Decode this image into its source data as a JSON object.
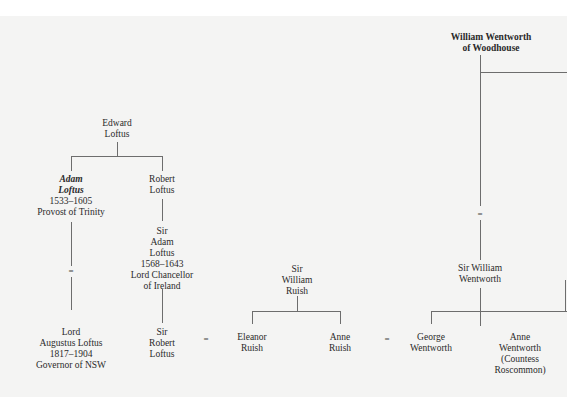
{
  "diagram": {
    "type": "family-tree",
    "nodes": {
      "william_wentworth_woodhouse": {
        "lines": [
          "William Wentworth",
          "of Woodhouse"
        ]
      },
      "edward_loftus": {
        "lines": [
          "Edward",
          "Loftus"
        ]
      },
      "adam_loftus": {
        "lines": [
          "Adam",
          "Loftus",
          "1533–1605",
          "Provost of Trinity"
        ]
      },
      "robert_loftus": {
        "lines": [
          "Robert",
          "Loftus"
        ]
      },
      "sir_adam_loftus": {
        "lines": [
          "Sir",
          "Adam",
          "Loftus",
          "1568–1643",
          "Lord Chancellor",
          "of Ireland"
        ]
      },
      "lord_augustus_loftus": {
        "lines": [
          "Lord",
          "Augustus Loftus",
          "1817–1904",
          "Governor of NSW"
        ]
      },
      "sir_robert_loftus": {
        "lines": [
          "Sir",
          "Robert",
          "Loftus"
        ]
      },
      "sir_william_ruish": {
        "lines": [
          "Sir",
          "William",
          "Ruish"
        ]
      },
      "eleanor_ruish": {
        "lines": [
          "Eleanor",
          "Ruish"
        ]
      },
      "anne_ruish": {
        "lines": [
          "Anne",
          "Ruish"
        ]
      },
      "sir_william_wentworth": {
        "lines": [
          "Sir William",
          "Wentworth"
        ]
      },
      "george_wentworth": {
        "lines": [
          "George",
          "Wentworth"
        ]
      },
      "anne_wentworth": {
        "lines": [
          "Anne",
          "Wentworth",
          "(Countess",
          "Roscommon)"
        ]
      }
    },
    "marriage_symbol": "=",
    "descent_symbol": "=",
    "relationships": [
      {
        "type": "parent-child",
        "parent": "Edward Loftus",
        "children": [
          "Adam Loftus",
          "Robert Loftus"
        ]
      },
      {
        "type": "descent",
        "from": "Adam Loftus",
        "to": "Lord Augustus Loftus"
      },
      {
        "type": "parent-child",
        "parent": "Robert Loftus",
        "children": [
          "Sir Adam Loftus"
        ]
      },
      {
        "type": "parent-child",
        "parent": "Sir Adam Loftus",
        "children": [
          "Sir Robert Loftus"
        ]
      },
      {
        "type": "marriage",
        "a": "Sir Robert Loftus",
        "b": "Eleanor Ruish"
      },
      {
        "type": "parent-child",
        "parent": "Sir William Ruish",
        "children": [
          "Eleanor Ruish",
          "Anne Ruish"
        ]
      },
      {
        "type": "marriage",
        "a": "Anne Ruish",
        "b": "George Wentworth"
      },
      {
        "type": "descent",
        "from": "William Wentworth of Woodhouse",
        "to": "Sir William Wentworth"
      },
      {
        "type": "parent-child",
        "parent": "Sir William Wentworth",
        "children": [
          "George Wentworth",
          "Anne Wentworth"
        ]
      }
    ]
  }
}
